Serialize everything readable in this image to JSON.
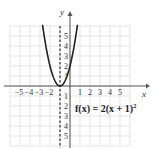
{
  "chart_data": {
    "type": "line",
    "title": "",
    "xlabel": "x",
    "ylabel": "y",
    "xlim": [
      -6,
      6
    ],
    "ylim": [
      -6,
      6
    ],
    "grid": true,
    "x_ticks": [
      "-5",
      "-4",
      "-3",
      "-2",
      "1",
      "2",
      "3",
      "4",
      "5"
    ],
    "y_ticks_positive": [
      "1",
      "2",
      "3",
      "4",
      "5"
    ],
    "y_ticks_negative": [
      "1",
      "2",
      "3",
      "4",
      "5"
    ],
    "series": [
      {
        "name": "f(x) = 2(x + 1)^2",
        "function": "2*(x+1)^2",
        "x": [
          -2.7,
          -2.5,
          -2,
          -1.5,
          -1,
          -0.5,
          0,
          0.5,
          0.7
        ],
        "y": [
          5.78,
          4.5,
          2,
          0.5,
          0,
          0.5,
          2,
          4.5,
          5.78
        ]
      }
    ],
    "annotations": [
      {
        "type": "dashed-vertical-line",
        "x": -1,
        "label": "axis of symmetry"
      },
      {
        "type": "text",
        "text": "f(x) = 2(x + 1)²",
        "position": "lower-right"
      }
    ]
  },
  "labels": {
    "x_axis": "x",
    "y_axis": "y",
    "equation_main": "f(x) = 2(x + 1)",
    "equation_exp": "2"
  }
}
